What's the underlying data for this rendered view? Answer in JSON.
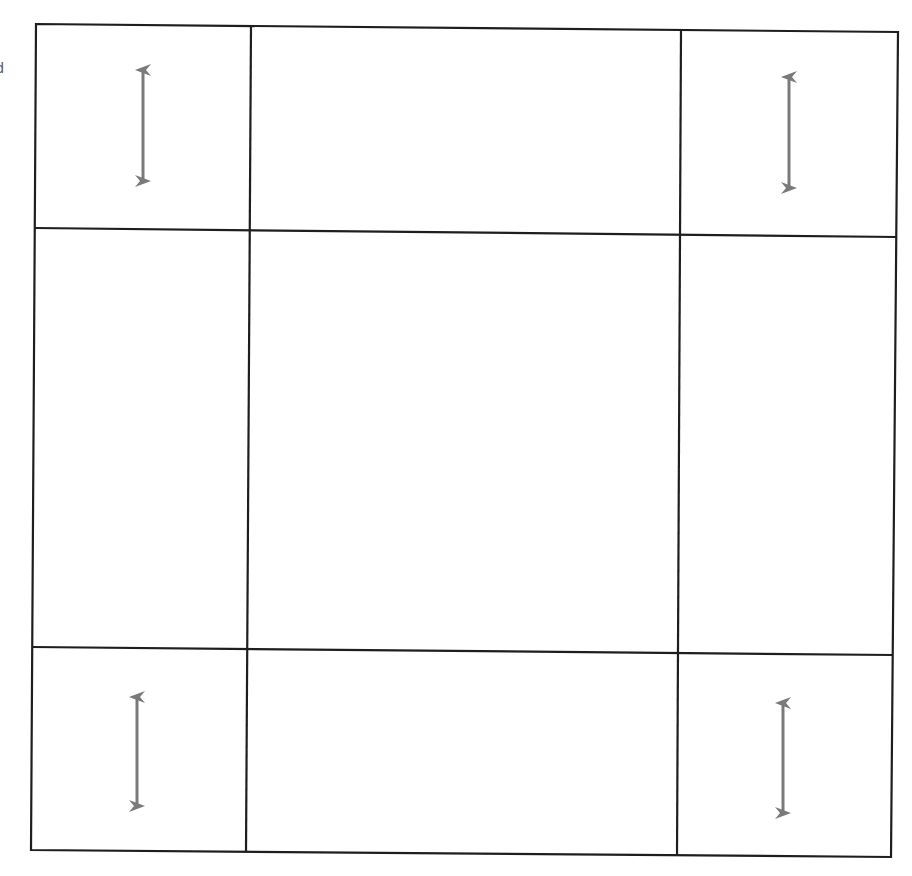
{
  "diagram": {
    "edge_text": "d",
    "colors": {
      "line": "#1e1e1e",
      "arrow": "#7a7a7a",
      "background": "#ffffff"
    },
    "grid": {
      "rows": 3,
      "cols": 3,
      "outer": {
        "tl": [
          36,
          24
        ],
        "tr": [
          898,
          32
        ],
        "br": [
          891,
          857
        ],
        "bl": [
          31,
          850
        ]
      },
      "vertical_lines": [
        {
          "top": [
            251,
            26
          ],
          "bottom": [
            246,
            852
          ]
        },
        {
          "top": [
            681,
            30
          ],
          "bottom": [
            677,
            856
          ]
        }
      ],
      "horizontal_lines": [
        {
          "left": [
            35,
            228
          ],
          "right": [
            897,
            237
          ]
        },
        {
          "left": [
            32,
            647
          ],
          "right": [
            893,
            655
          ]
        }
      ]
    },
    "arrows": [
      {
        "cell": "top-left",
        "x": 143,
        "y1": 68,
        "y2": 183
      },
      {
        "cell": "top-right",
        "x": 789,
        "y1": 75,
        "y2": 190
      },
      {
        "cell": "bottom-left",
        "x": 137,
        "y1": 695,
        "y2": 808
      },
      {
        "cell": "bottom-right",
        "x": 783,
        "y1": 701,
        "y2": 815
      }
    ]
  }
}
